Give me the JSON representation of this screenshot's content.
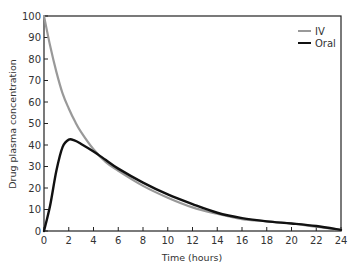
{
  "chart_data": {
    "type": "line",
    "title": "",
    "xlabel": "Time (hours)",
    "ylabel": "Drug plasma concentration",
    "xlim": [
      0,
      24
    ],
    "ylim": [
      0,
      100
    ],
    "x_ticks": [
      0,
      2,
      4,
      6,
      8,
      10,
      12,
      14,
      16,
      18,
      20,
      22,
      24
    ],
    "y_ticks": [
      0,
      10,
      20,
      30,
      40,
      50,
      60,
      70,
      80,
      90,
      100
    ],
    "grid": false,
    "legend_position": "top-right",
    "x": [
      0,
      0.5,
      1,
      1.5,
      2,
      2.5,
      3,
      4,
      5,
      6,
      8,
      10,
      12,
      14,
      16,
      18,
      20,
      22,
      24
    ],
    "series": [
      {
        "name": "IV",
        "color": "#999999",
        "values": [
          100,
          86,
          74,
          64,
          57,
          51,
          46,
          38,
          32,
          28,
          21,
          15.5,
          11,
          8,
          5.5,
          4.5,
          3.5,
          2,
          0.5
        ]
      },
      {
        "name": "Oral",
        "color": "#111111",
        "values": [
          0,
          12,
          28,
          39,
          42.5,
          42,
          40.5,
          37,
          33,
          29,
          22.5,
          17,
          12.5,
          8.5,
          6,
          4.5,
          3.5,
          2.3,
          0.5
        ]
      }
    ]
  }
}
